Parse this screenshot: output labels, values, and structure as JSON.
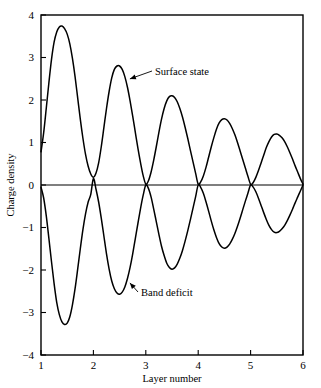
{
  "chart_data": {
    "type": "line",
    "title": "",
    "xlabel": "Layer number",
    "ylabel": "Charge density",
    "xlim": [
      1,
      6
    ],
    "ylim": [
      -4,
      4
    ],
    "xticks": [
      1,
      2,
      3,
      4,
      5,
      6
    ],
    "xticklabels": [
      "1",
      "2",
      "3",
      "4",
      "5",
      "6"
    ],
    "yticks": [
      -4,
      -3,
      -2,
      -1,
      0,
      1,
      2,
      3,
      4
    ],
    "yticklabels": [
      "−4",
      "−3",
      "−2",
      "−1",
      "0",
      "1",
      "2",
      "3",
      "4"
    ],
    "grid": false,
    "legend_position": "none",
    "annotations": [
      {
        "label": "Surface state",
        "points_to_x": 2.62,
        "points_to_y": 2.45
      },
      {
        "label": "Band deficit",
        "points_to_x": 2.62,
        "points_to_y": -2.35
      }
    ],
    "series": [
      {
        "name": "Surface state",
        "x": [
          1.0,
          1.05,
          1.1,
          1.15,
          1.2,
          1.25,
          1.3,
          1.35,
          1.4,
          1.45,
          1.5,
          1.55,
          1.6,
          1.65,
          1.7,
          1.75,
          1.8,
          1.85,
          1.9,
          1.95,
          2.0,
          2.05,
          2.1,
          2.15,
          2.2,
          2.25,
          2.3,
          2.35,
          2.4,
          2.45,
          2.5,
          2.55,
          2.6,
          2.65,
          2.7,
          2.75,
          2.8,
          2.85,
          2.9,
          2.95,
          3.0,
          3.05,
          3.1,
          3.15,
          3.2,
          3.25,
          3.3,
          3.35,
          3.4,
          3.45,
          3.5,
          3.55,
          3.6,
          3.65,
          3.7,
          3.75,
          3.8,
          3.85,
          3.9,
          3.95,
          4.0,
          4.05,
          4.1,
          4.15,
          4.2,
          4.25,
          4.3,
          4.35,
          4.4,
          4.45,
          4.5,
          4.55,
          4.6,
          4.65,
          4.7,
          4.75,
          4.8,
          4.85,
          4.9,
          4.95,
          5.0,
          5.05,
          5.1,
          5.15,
          5.2,
          5.25,
          5.3,
          5.35,
          5.4,
          5.45,
          5.5,
          5.55,
          5.6,
          5.65,
          5.7,
          5.75,
          5.8,
          5.85,
          5.9,
          5.95,
          6.0
        ],
        "y": [
          0.78,
          1.22,
          1.8,
          2.4,
          2.95,
          3.36,
          3.6,
          3.72,
          3.74,
          3.68,
          3.55,
          3.32,
          2.98,
          2.55,
          2.05,
          1.55,
          1.1,
          0.72,
          0.44,
          0.26,
          0.18,
          0.28,
          0.52,
          0.9,
          1.35,
          1.8,
          2.2,
          2.52,
          2.72,
          2.8,
          2.8,
          2.72,
          2.55,
          2.3,
          1.98,
          1.62,
          1.24,
          0.86,
          0.52,
          0.22,
          0.02,
          0.1,
          0.3,
          0.58,
          0.9,
          1.24,
          1.55,
          1.8,
          1.98,
          2.08,
          2.1,
          2.06,
          1.96,
          1.8,
          1.6,
          1.36,
          1.1,
          0.82,
          0.55,
          0.28,
          0.02,
          0.08,
          0.22,
          0.42,
          0.66,
          0.9,
          1.12,
          1.32,
          1.46,
          1.54,
          1.56,
          1.53,
          1.45,
          1.33,
          1.18,
          1.0,
          0.8,
          0.6,
          0.4,
          0.2,
          0.02,
          0.06,
          0.18,
          0.34,
          0.52,
          0.7,
          0.88,
          1.02,
          1.13,
          1.19,
          1.2,
          1.17,
          1.11,
          1.02,
          0.9,
          0.76,
          0.61,
          0.45,
          0.3,
          0.15,
          0.02
        ]
      },
      {
        "name": "Band deficit",
        "x": [
          1.0,
          1.05,
          1.1,
          1.15,
          1.2,
          1.25,
          1.3,
          1.35,
          1.4,
          1.45,
          1.5,
          1.55,
          1.6,
          1.65,
          1.7,
          1.75,
          1.8,
          1.85,
          1.9,
          1.95,
          2.0,
          2.05,
          2.1,
          2.15,
          2.2,
          2.25,
          2.3,
          2.35,
          2.4,
          2.45,
          2.5,
          2.55,
          2.6,
          2.65,
          2.7,
          2.75,
          2.8,
          2.85,
          2.9,
          2.95,
          3.0,
          3.05,
          3.1,
          3.15,
          3.2,
          3.25,
          3.3,
          3.35,
          3.4,
          3.45,
          3.5,
          3.55,
          3.6,
          3.65,
          3.7,
          3.75,
          3.8,
          3.85,
          3.9,
          3.95,
          4.0,
          4.05,
          4.1,
          4.15,
          4.2,
          4.25,
          4.3,
          4.35,
          4.4,
          4.45,
          4.5,
          4.55,
          4.6,
          4.65,
          4.7,
          4.75,
          4.8,
          4.85,
          4.9,
          4.95,
          5.0,
          5.05,
          5.1,
          5.15,
          5.2,
          5.25,
          5.3,
          5.35,
          5.4,
          5.45,
          5.5,
          5.55,
          5.6,
          5.65,
          5.7,
          5.75,
          5.8,
          5.85,
          5.9,
          5.95,
          6.0
        ],
        "y": [
          -0.05,
          -0.3,
          -0.72,
          -1.25,
          -1.8,
          -2.32,
          -2.76,
          -3.05,
          -3.22,
          -3.28,
          -3.25,
          -3.1,
          -2.82,
          -2.44,
          -1.98,
          -1.5,
          -1.05,
          -0.68,
          -0.4,
          -0.22,
          0.15,
          -0.1,
          -0.4,
          -0.78,
          -1.2,
          -1.62,
          -1.98,
          -2.26,
          -2.44,
          -2.54,
          -2.57,
          -2.52,
          -2.4,
          -2.2,
          -1.94,
          -1.62,
          -1.26,
          -0.9,
          -0.55,
          -0.24,
          0.0,
          -0.08,
          -0.28,
          -0.56,
          -0.86,
          -1.16,
          -1.44,
          -1.66,
          -1.84,
          -1.94,
          -1.98,
          -1.95,
          -1.86,
          -1.72,
          -1.54,
          -1.32,
          -1.08,
          -0.82,
          -0.55,
          -0.28,
          0.0,
          -0.06,
          -0.2,
          -0.4,
          -0.62,
          -0.85,
          -1.06,
          -1.24,
          -1.38,
          -1.46,
          -1.49,
          -1.46,
          -1.39,
          -1.28,
          -1.14,
          -0.97,
          -0.78,
          -0.58,
          -0.38,
          -0.19,
          0.0,
          -0.05,
          -0.16,
          -0.31,
          -0.48,
          -0.65,
          -0.81,
          -0.95,
          -1.05,
          -1.11,
          -1.12,
          -1.09,
          -1.03,
          -0.95,
          -0.84,
          -0.71,
          -0.57,
          -0.42,
          -0.28,
          -0.14,
          0.0
        ]
      }
    ]
  },
  "figure": {
    "axis_color": "#000000",
    "curve_color": "#000000",
    "background": "#ffffff"
  }
}
